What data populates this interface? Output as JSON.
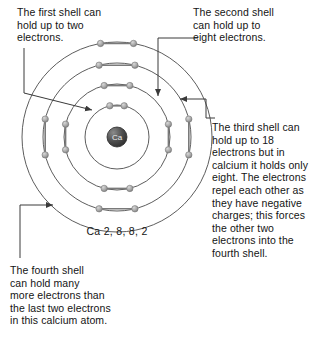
{
  "diagram": {
    "type": "bohr-atom-shell-diagram",
    "element_symbol": "Ca",
    "element_name": "calcium",
    "caption": "Ca 2, 8, 8, 2",
    "nucleus_label": "Ca",
    "shell_config": [
      2,
      8,
      8,
      2
    ],
    "shell_count": 4,
    "center": {
      "x": 117,
      "y": 137
    },
    "shells": [
      {
        "index": 1,
        "name": "first-shell",
        "radius": 32,
        "electrons": 2,
        "electron_angles": [
          -103,
          -77
        ]
      },
      {
        "index": 2,
        "name": "second-shell",
        "radius": 53,
        "electrons": 8,
        "electron_angles": [
          -104,
          -76,
          -14,
          14,
          76,
          104,
          166,
          194
        ]
      },
      {
        "index": 3,
        "name": "third-shell",
        "radius": 74,
        "electrons": 8,
        "electron_angles": [
          -104,
          -76,
          -14,
          14,
          76,
          104,
          166,
          194
        ]
      },
      {
        "index": 4,
        "name": "fourth-shell",
        "radius": 95,
        "electrons": 2,
        "electron_angles": [
          -100,
          -80
        ]
      }
    ],
    "colors": {
      "shell_stroke": "#5d5d5d",
      "electron_fill": "#a9a9a9",
      "electron_stroke": "#7a7a7a",
      "nucleus_fill": "#4a4a4a",
      "leader_stroke": "#3a3a3a",
      "text": "#141414",
      "background": "#ffffff"
    }
  },
  "callouts": {
    "first_shell": {
      "id": "first-shell-callout",
      "text": "The first shell can\nhold up to two\nelectrons.",
      "points_at": "first-shell"
    },
    "second_shell": {
      "id": "second-shell-callout",
      "text": "The second shell\ncan hold up to\neight electrons.",
      "points_at": "second-shell"
    },
    "third_shell": {
      "id": "third-shell-callout",
      "text": "The third shell can\nhold up to 18\nelectrons but in\ncalcium it holds only\neight. The electrons\nrepel each other as\nthey have negative\ncharges; this forces\nthe other two\nelectrons into the\nfourth shell.",
      "points_at": "third-shell"
    },
    "fourth_shell": {
      "id": "fourth-shell-callout",
      "text": "The fourth shell\ncan hold many\nmore electrons than\nthe last two electrons\nin this calcium atom.",
      "points_at": "fourth-shell"
    }
  }
}
